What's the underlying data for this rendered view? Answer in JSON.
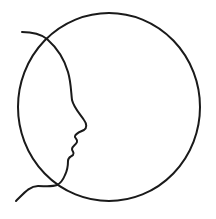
{
  "illustration": {
    "title": "Face profile in circle",
    "stroke_color": "#1a1a1a",
    "background_color": "#ffffff",
    "stroke_width": 2,
    "circle": {
      "cx": 109,
      "cy": 107,
      "rx": 91,
      "ry": 94
    },
    "profile_path": "M 22 32 C 34 32, 42 35, 47 39 C 56 47, 64 58, 68 72 C 71 82, 71 92, 72 100 C 74 108, 80 114, 84 120 C 87 124, 87 128, 84 130 C 80 132, 76 133, 75 136 C 74 138, 78 139, 77 142 C 76 145, 72 146, 72 149 C 72 152, 75 152, 73 155 C 71 157, 68 157, 68 161 C 68 166, 67 171, 65 175 C 63 180, 61 183, 57 185 C 52 187, 45 186, 38 186 C 30 186, 25 192, 16 201"
  }
}
